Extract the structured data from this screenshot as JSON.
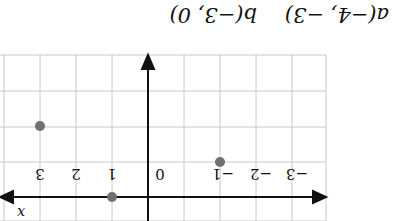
{
  "caption": {
    "point_a": "a(−4, −3)",
    "point_b": "b(−3, 0)"
  },
  "axes": {
    "x_label": "x",
    "tick_labels": [
      "−3",
      "−2",
      "−1",
      "0",
      "1",
      "2",
      "3"
    ]
  },
  "points": [
    {
      "name": "point-near-x-axis",
      "x": -1,
      "y": 0
    },
    {
      "name": "point-left-low",
      "x": -3,
      "y": -2
    },
    {
      "name": "point-right",
      "x": 2,
      "y": -1
    }
  ],
  "colors": {
    "grid": "#c8c8c8",
    "axis": "#111111",
    "point": "#707070"
  }
}
